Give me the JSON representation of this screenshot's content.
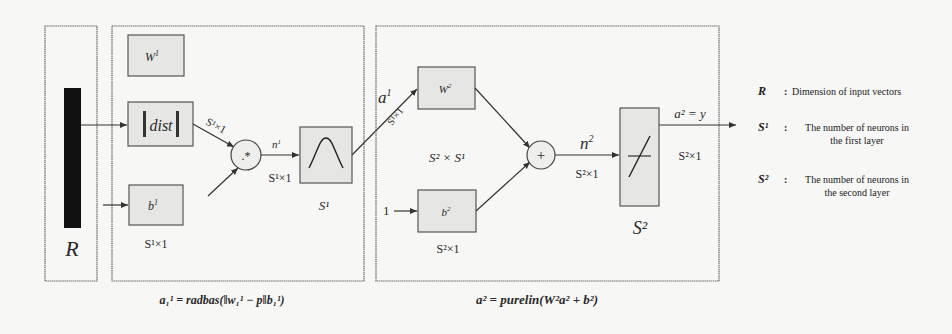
{
  "input": {
    "label": "R"
  },
  "layer1": {
    "weight_label": "W",
    "weight_sup": "1",
    "dist_label": "dist",
    "dist_dim": "S¹×1",
    "bias_label": "b",
    "bias_sup": "1",
    "bias_dim": "S¹×1",
    "mult_symbol": ".*",
    "net_label": "n",
    "net_sup": "1",
    "net_dim": "S¹×1",
    "transfer_size": "S¹",
    "output_label": "a",
    "output_sup": "1",
    "output_dim": "S¹×1",
    "formula": "a₁¹ = radbas(‖w₁¹ − p‖b₁¹)"
  },
  "layer2": {
    "weight_label": "W",
    "weight_sup": "2",
    "weight_dim": "S² × S¹",
    "bias_input": "1",
    "bias_label": "b",
    "bias_sup": "2",
    "bias_dim": "S²×1",
    "sum_symbol": "+",
    "net_label": "n",
    "net_sup": "2",
    "net_dim": "S²×1",
    "transfer_size": "S²",
    "output_label": "a² = y",
    "output_dim": "S²×1",
    "formula": "a² = purelin(W²a² + b²)"
  },
  "legend": [
    {
      "symbol": "R",
      "desc_line1": "Dimension of input vectors",
      "desc_line2": ""
    },
    {
      "symbol": "S¹",
      "desc_line1": "The number of neurons in",
      "desc_line2": "the first layer"
    },
    {
      "symbol": "S²",
      "desc_line1": "The number of neurons in",
      "desc_line2": "the second layer"
    }
  ],
  "colors": {
    "box_fill": "#e6e6e4",
    "frame_stroke": "#6a6a6a",
    "input_bar": "#111111"
  }
}
